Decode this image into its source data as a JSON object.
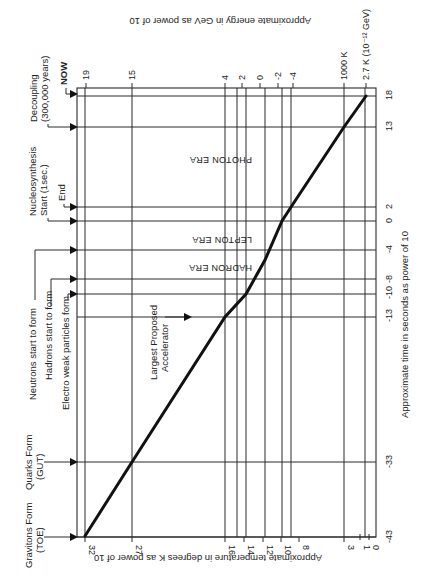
{
  "diagram": {
    "x_axis_label": "Approximate temperature in degrees K as power of 10",
    "top_axis_label": "Approximate energy in GeV as power of 10",
    "time_axis_label": "Approximate time in seconds as power of 10",
    "temperature_ticks": [
      "32",
      "27",
      "16",
      "14",
      "12",
      "10",
      "8",
      "3",
      "1",
      "0"
    ],
    "energy_ticks": [
      "19",
      "15",
      "4",
      "2",
      "0",
      "-2",
      "-4",
      "1000 K",
      "2.7 K (10⁻¹² GeV)"
    ],
    "time_ticks": [
      "18",
      "13",
      "2",
      "0",
      "-4",
      "-8",
      "-10",
      "-13",
      "-33",
      "-43"
    ],
    "events": {
      "now": "NOW",
      "decoupling_1": "Decoupling",
      "decoupling_2": "(300,000 years)",
      "nucleo_1": "Nucleosynthesis",
      "nucleo_2": "Start (1sec.)",
      "nucleo_end": "End",
      "neutrons": "Neutrons start to form",
      "hadrons": "Hadrons start to form",
      "electroweak": "Electro weak particles form",
      "quarks_1": "Quarks Form",
      "quarks_2": "(GUT)",
      "gravitons_1": "Gravitons Form",
      "gravitons_2": "(TOE)",
      "accelerator_1": "Largest Proposed",
      "accelerator_2": "Accelerator"
    },
    "eras": {
      "photon": "PHOTON ERA",
      "lepton": "LEPTON ERA",
      "hadron": "HADRON ERA"
    }
  }
}
